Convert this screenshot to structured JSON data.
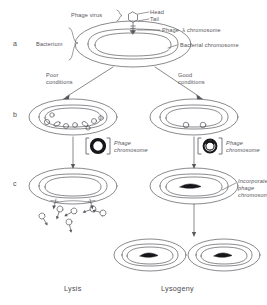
{
  "figure": {
    "title_implicit": "Bacteriophage lambda life cycle",
    "background_color": "#ffffff",
    "ink_color": "#57565c",
    "rows": [
      {
        "id": "a",
        "label": "a"
      },
      {
        "id": "b",
        "label": "b"
      },
      {
        "id": "c",
        "label": "c"
      }
    ],
    "row_a": {
      "phage_virus_label": "Phage virus",
      "head_label": "Head",
      "tail_label": "Tail",
      "bacterium_label": "Bacterium",
      "phage_chromosome_label": "Phage  λ chromosome",
      "bacterial_chromosome_label": "Bacterial chromosome"
    },
    "branches": {
      "left_condition_line1": "Poor",
      "left_condition_line2": "conditions",
      "right_condition_line1": "Good",
      "right_condition_line2": "conditions"
    },
    "row_b": {
      "left_inset_label_line1": "Phage",
      "left_inset_label_line2": "chromosome",
      "right_inset_label_line1": "Phage",
      "right_inset_label_line2": "chromosome",
      "left_phage_copies": 9,
      "right_phage_copies": 2
    },
    "row_c": {
      "incorporated_line1": "Incorporated",
      "incorporated_line2": "phage",
      "incorporated_line3": "chromosome",
      "released_phage_count": 6
    },
    "outcomes": {
      "left": "Lysis",
      "right": "Lysogeny"
    }
  }
}
